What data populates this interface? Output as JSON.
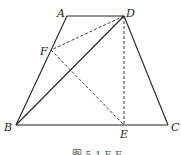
{
  "diagram": {
    "type": "geometry",
    "shape": "trapezoid ABCD with auxiliary segments",
    "points": {
      "A": {
        "label": "A",
        "x": 67,
        "y": 16
      },
      "D": {
        "label": "D",
        "x": 124,
        "y": 16
      },
      "B": {
        "label": "B",
        "x": 16,
        "y": 125
      },
      "C": {
        "label": "C",
        "x": 168,
        "y": 125
      },
      "E": {
        "label": "E",
        "x": 124,
        "y": 125
      },
      "F": {
        "label": "F",
        "x": 51,
        "y": 50
      }
    },
    "solid_segments": [
      "AD",
      "AB",
      "DC",
      "BC",
      "BD"
    ],
    "dashed_segments": [
      "DF",
      "DE",
      "FE"
    ],
    "caption": "图 5-1 E F",
    "stroke_color": "#222222"
  }
}
